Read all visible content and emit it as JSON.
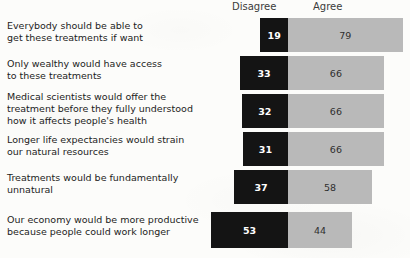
{
  "chart_data": {
    "type": "bar",
    "subtype": "diverging-stacked-bar",
    "title": "",
    "xlabel": "",
    "ylabel": "",
    "grid": false,
    "legend_position": "top",
    "axis_note": "Percent; Disagree extends left of centre divider, Agree extends right",
    "legend": [
      {
        "key": "disagree",
        "label": "Disagree",
        "color": "#141414"
      },
      {
        "key": "agree",
        "label": "Agree",
        "color": "#b9b9b9"
      }
    ],
    "categories": [
      "Everybody should be able to\nget these treatments if want",
      "Only wealthy would have access\nto these treatments",
      "Medical scientists would offer the\ntreatment before they fully understood\nhow it affects people's health",
      "Longer life expectancies would strain\nour natural resources",
      "Treatments would be fundamentally\nunnatural",
      "Our economy would be more productive\nbecause people could work longer"
    ],
    "series": [
      {
        "name": "Disagree",
        "values": [
          19,
          33,
          32,
          31,
          37,
          53
        ]
      },
      {
        "name": "Agree",
        "values": [
          79,
          66,
          66,
          66,
          58,
          44
        ]
      }
    ]
  },
  "header": {
    "disagree_label": "Disagree",
    "agree_label": "Agree"
  },
  "rows": [
    {
      "label": "Everybody should be able to\nget these treatments if want",
      "disagree": "19",
      "agree": "79",
      "disagree_value": 19,
      "agree_value": 79
    },
    {
      "label": "Only wealthy would have access\nto these treatments",
      "disagree": "33",
      "agree": "66",
      "disagree_value": 33,
      "agree_value": 66
    },
    {
      "label": "Medical scientists would offer the\ntreatment before they fully understood\nhow it affects people's health",
      "disagree": "32",
      "agree": "66",
      "disagree_value": 32,
      "agree_value": 66
    },
    {
      "label": "Longer life expectancies would strain\nour natural resources",
      "disagree": "31",
      "agree": "66",
      "disagree_value": 31,
      "agree_value": 66
    },
    {
      "label": "Treatments would be fundamentally\nunnatural",
      "disagree": "37",
      "agree": "58",
      "disagree_value": 37,
      "agree_value": 58
    },
    {
      "label": "Our economy would be more productive\nbecause people could work longer",
      "disagree": "53",
      "agree": "44",
      "disagree_value": 53,
      "agree_value": 44
    }
  ],
  "layout": {
    "divider_x": 288,
    "scale_px_per_unit": 1.452,
    "row_top": [
      18,
      56,
      94,
      132,
      170,
      212
    ],
    "label_top": [
      20,
      58,
      91,
      134,
      172,
      214
    ],
    "bar_height": 34,
    "bar_height_last": 36
  },
  "colors": {
    "disagree": "#141414",
    "agree": "#b9b9b9",
    "background": "#fcfcfa",
    "text": "#1c1c1c",
    "header_text": "#3b3b3b"
  }
}
